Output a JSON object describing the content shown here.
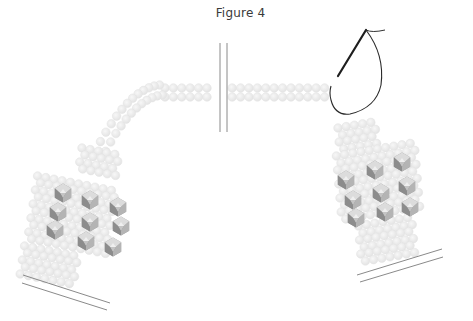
{
  "figure": {
    "title": "Figure 4"
  },
  "colors": {
    "bead_fill": "#ececec",
    "bead_stroke": "#e0e0e0",
    "crystal_light": "#d9d9d9",
    "crystal_mid": "#a8a8a8",
    "crystal_dark": "#7a7a7a",
    "thread": "#222222",
    "clasp_line": "#8a8a8a",
    "break_line": "#8a8a8a"
  },
  "illustration": {
    "elements": [
      "left-bracelet-panel",
      "upper-bead-strand",
      "break-marker",
      "right-bracelet-panel",
      "needle-and-thread"
    ],
    "left_panel_crystals": [
      [
        63,
        193
      ],
      [
        90,
        200
      ],
      [
        118,
        207
      ],
      [
        58,
        212
      ],
      [
        90,
        222
      ],
      [
        121,
        226
      ],
      [
        55,
        230
      ],
      [
        86,
        241
      ],
      [
        113,
        247
      ]
    ],
    "right_panel_crystals": [
      [
        346,
        180
      ],
      [
        375,
        170
      ],
      [
        402,
        162
      ],
      [
        353,
        200
      ],
      [
        381,
        193
      ],
      [
        407,
        186
      ],
      [
        356,
        218
      ],
      [
        385,
        212
      ],
      [
        410,
        207
      ]
    ]
  }
}
